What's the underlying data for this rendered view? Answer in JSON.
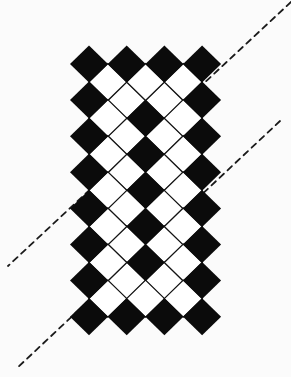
{
  "figure": {
    "colors": {
      "black": "#0b0b0b",
      "white": "#ffffff",
      "background": "#fbfbfb",
      "outline": "#141414"
    },
    "grid": {
      "origin_x": 89,
      "origin_y": 64,
      "step_x": 37.7,
      "step_y": 36.1,
      "half_w": 19,
      "half_h": 18.5,
      "cols": 4,
      "rows": 8,
      "integer_rows": [
        [
          "B",
          "B",
          "B",
          "B"
        ],
        [
          "B",
          "W",
          "W",
          "B"
        ],
        [
          "B",
          "W",
          "W",
          "B"
        ],
        [
          "B",
          "W",
          "W",
          "B"
        ],
        [
          "B",
          "W",
          "W",
          "B"
        ],
        [
          "B",
          "W",
          "W",
          "B"
        ],
        [
          "B",
          "W",
          "W",
          "B"
        ],
        [
          "B",
          "B",
          "B",
          "B"
        ]
      ],
      "half_rows": [
        [
          "W",
          "W",
          "W"
        ],
        [
          "W",
          "B",
          "W"
        ],
        [
          "W",
          "B",
          "W"
        ],
        [
          "W",
          "B",
          "W"
        ],
        [
          "W",
          "B",
          "W"
        ],
        [
          "W",
          "B",
          "W"
        ],
        [
          "W",
          "W",
          "W"
        ]
      ]
    },
    "dashed_lines": [
      {
        "name": "upper-diagonal",
        "x1": 291,
        "y1": 2,
        "x2": 8,
        "y2": 266
      },
      {
        "name": "lower-diagonal",
        "x1": 280,
        "y1": 121,
        "x2": 16,
        "y2": 369
      }
    ]
  }
}
